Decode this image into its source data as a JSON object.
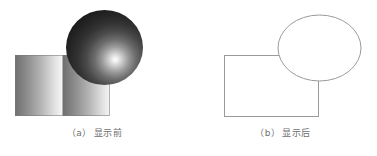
{
  "figure": {
    "width": 377,
    "height": 156,
    "background": "#ffffff",
    "panels": [
      {
        "id": "a",
        "caption": "（a）显示前",
        "caption_label": "（a）",
        "caption_text": "显示前",
        "style": "shaded-filled",
        "shapes": [
          {
            "name": "gradient-rectangle",
            "type": "rectangle",
            "x": 15,
            "y": 55,
            "width": 95,
            "height": 61,
            "fill": "repeating-linear-gradient",
            "gradient_direction": "left-to-right",
            "gradient_bands": 2,
            "gradient_from": "#6f6f6f",
            "gradient_to": "#f6f6f6",
            "stroke": "#787878"
          },
          {
            "name": "shaded-sphere",
            "type": "ellipse",
            "x": 66,
            "y": 10,
            "width": 77,
            "height": 75,
            "fill": "radial-gradient",
            "highlight_x_pct": 64,
            "highlight_y_pct": 66,
            "highlight_color": "#ffffff",
            "shadow_color": "#171717",
            "z_order": "front"
          }
        ]
      },
      {
        "id": "b",
        "caption": "（b）显示后",
        "caption_label": "（b）",
        "caption_text": "显示后",
        "style": "wireframe-outline",
        "shapes": [
          {
            "name": "outline-rectangle",
            "type": "rectangle",
            "x": 35,
            "y": 55,
            "width": 94,
            "height": 61,
            "fill": "#ffffff",
            "stroke": "#9a9a9a",
            "stroke_width": 1,
            "z_order": "back"
          },
          {
            "name": "outline-ellipse",
            "type": "ellipse",
            "cx": 130.5,
            "cy": 48,
            "rx": 41.5,
            "ry": 33,
            "fill": "#ffffff",
            "stroke": "#9a9a9a",
            "stroke_width": 1,
            "z_order": "front"
          }
        ]
      }
    ]
  },
  "colors": {
    "page_background": "#ffffff",
    "outline_stroke": "#9a9a9a",
    "caption_text": "#6e6e6e",
    "gradient_dark": "#6f6f6f",
    "gradient_light": "#f6f6f6",
    "sphere_highlight": "#ffffff",
    "sphere_shadow": "#171717"
  }
}
